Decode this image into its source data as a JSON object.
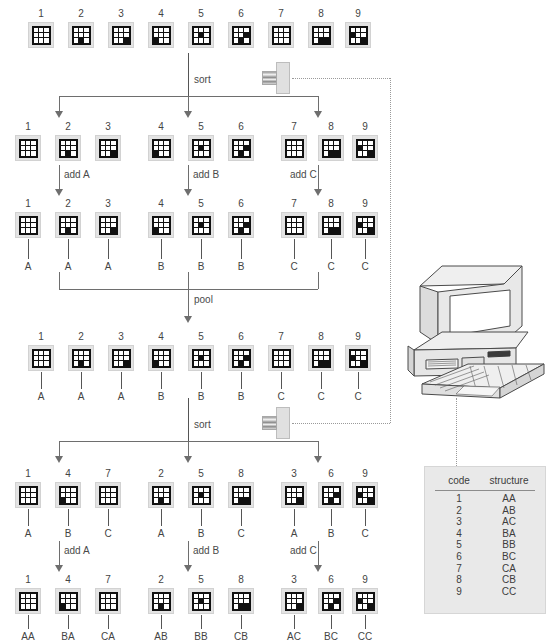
{
  "diagram": {
    "operations": {
      "sort_1": "sort",
      "add_a_1": "add A",
      "add_b_1": "add B",
      "add_c_1": "add C",
      "pool": "pool",
      "sort_2": "sort",
      "add_a_2": "add A",
      "add_b_2": "add B",
      "add_c_2": "add C"
    },
    "rows": [
      {
        "id": "row-initial",
        "layout": "even",
        "codes": [
          "1",
          "2",
          "3",
          "4",
          "5",
          "6",
          "7",
          "8",
          "9"
        ],
        "tags": []
      },
      {
        "id": "row-sorted-1",
        "layout": "grouped",
        "codes": [
          "1",
          "2",
          "3",
          "4",
          "5",
          "6",
          "7",
          "8",
          "9"
        ],
        "tags": []
      },
      {
        "id": "row-tagged-1",
        "layout": "grouped",
        "codes": [
          "1",
          "2",
          "3",
          "4",
          "5",
          "6",
          "7",
          "8",
          "9"
        ],
        "tags": [
          "A",
          "A",
          "A",
          "B",
          "B",
          "B",
          "C",
          "C",
          "C"
        ]
      },
      {
        "id": "row-pooled",
        "layout": "even",
        "codes": [
          "1",
          "2",
          "3",
          "4",
          "5",
          "6",
          "7",
          "8",
          "9"
        ],
        "tags": [
          "A",
          "A",
          "A",
          "B",
          "B",
          "B",
          "C",
          "C",
          "C"
        ]
      },
      {
        "id": "row-sorted-2",
        "layout": "grouped",
        "codes": [
          "1",
          "4",
          "7",
          "2",
          "5",
          "8",
          "3",
          "6",
          "9"
        ],
        "tags": [
          "A",
          "B",
          "C",
          "A",
          "B",
          "C",
          "A",
          "B",
          "C"
        ]
      },
      {
        "id": "row-tagged-2",
        "layout": "grouped",
        "codes": [
          "1",
          "4",
          "7",
          "2",
          "5",
          "8",
          "3",
          "6",
          "9"
        ],
        "tags": [
          "AA",
          "BA",
          "CA",
          "AB",
          "BB",
          "CB",
          "AC",
          "BC",
          "CC"
        ]
      }
    ],
    "devices": {
      "scanner_top": "barcode-scanner",
      "scanner_bottom": "barcode-scanner",
      "computer": "desktop-computer"
    },
    "code_table": {
      "headers": [
        "code",
        "structure"
      ],
      "rows": [
        [
          "1",
          "AA"
        ],
        [
          "2",
          "AB"
        ],
        [
          "3",
          "AC"
        ],
        [
          "4",
          "BA"
        ],
        [
          "5",
          "BB"
        ],
        [
          "6",
          "BC"
        ],
        [
          "7",
          "CA"
        ],
        [
          "8",
          "CB"
        ],
        [
          "9",
          "CC"
        ]
      ]
    },
    "colors": {
      "tile_frame": "#e3e3e3",
      "chip_background": "#111111",
      "chip_dot": "#ffffff",
      "line": "#6e6e6e",
      "dotted_link": "#9a9a9a",
      "panel": "#e9e9e9",
      "text": "#3d3d3d"
    }
  }
}
